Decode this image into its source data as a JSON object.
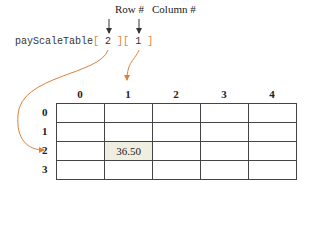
{
  "labels": {
    "row": "Row #",
    "column": "Column #"
  },
  "expression": {
    "name": "payScaleTable",
    "open1": "[",
    "index1": "2",
    "close1": "]",
    "open2": "[",
    "index2": "1",
    "close2": "]"
  },
  "table": {
    "column_headers": [
      "0",
      "1",
      "2",
      "3",
      "4"
    ],
    "row_headers": [
      "0",
      "1",
      "2",
      "3"
    ],
    "highlight": {
      "row": 2,
      "col": 1,
      "value": "36.50"
    }
  },
  "colors": {
    "arrow": "#d9823b",
    "highlight_fill": "#efeee0",
    "grid": "#444444"
  }
}
